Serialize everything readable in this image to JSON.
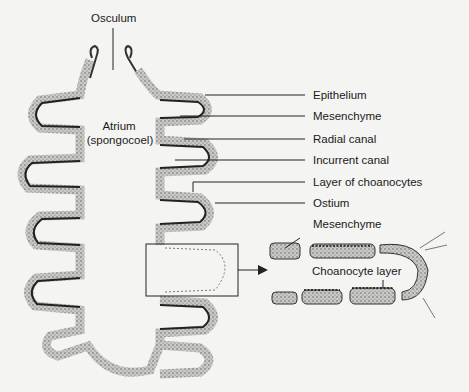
{
  "figure": {
    "type": "anatomical diagram",
    "labels": {
      "osculum": "Osculum",
      "atrium_line1": "Atrium",
      "atrium_line2": "(spongocoel)",
      "epithelium": "Epithelium",
      "mesenchyme": "Mesenchyme",
      "radial_canal": "Radial canal",
      "incurrent_canal": "Incurrent canal",
      "layer_of_choanocytes": "Layer of choanocytes",
      "ostium": "Ostium",
      "inset_mesenchyme": "Mesenchyme",
      "inset_choanocyte_layer": "Choanocyte layer"
    },
    "colors": {
      "background": "#f4f4f2",
      "ink": "#1a1a1a",
      "stipple": "#6a6a6a"
    }
  }
}
